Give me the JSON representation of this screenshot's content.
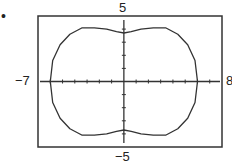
{
  "bullet": "•",
  "labels": {
    "ymax": "5",
    "ymin": "−5",
    "xmin": "−7",
    "xmax": "8"
  },
  "chart_data": {
    "type": "line",
    "title": "",
    "xlabel": "",
    "ylabel": "",
    "xlim": [
      -7,
      8
    ],
    "ylim": [
      -5,
      5
    ],
    "grid": false,
    "tick_spacing": 1,
    "series": [
      {
        "name": "curve",
        "x": [
          6.0,
          5.8,
          5.2,
          4.4,
          3.4,
          2.4,
          1.4,
          0.6,
          0,
          -0.6,
          -1.4,
          -2.4,
          -3.4,
          -4.4,
          -5.2,
          -5.8,
          -6.0,
          -5.8,
          -5.2,
          -4.4,
          -3.4,
          -2.4,
          -1.4,
          -0.6,
          0,
          0.6,
          1.4,
          2.4,
          3.4,
          4.4,
          5.2,
          5.8,
          6.0
        ],
        "y": [
          0,
          1.6,
          2.8,
          3.6,
          4.1,
          4.1,
          4.0,
          3.8,
          3.7,
          3.8,
          4.0,
          4.1,
          4.1,
          3.6,
          2.8,
          1.6,
          0,
          -1.6,
          -2.8,
          -3.6,
          -4.1,
          -4.1,
          -4.0,
          -3.8,
          -3.7,
          -3.8,
          -4.0,
          -4.1,
          -4.1,
          -3.6,
          -2.8,
          -1.6,
          0
        ]
      }
    ]
  }
}
